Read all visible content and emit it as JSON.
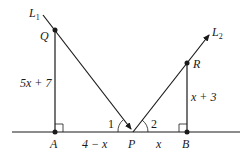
{
  "diagram": {
    "lines": {
      "l1": {
        "label": "L",
        "subscript": "1"
      },
      "l2": {
        "label": "L",
        "subscript": "2"
      }
    },
    "points": {
      "Q": "Q",
      "R": "R",
      "A": "A",
      "P": "P",
      "B": "B"
    },
    "segments": {
      "QA": "5x + 7",
      "RB": "x + 3",
      "AP": "4 − x",
      "PB": "x"
    },
    "angles": {
      "angle1": "1",
      "angle2": "2"
    },
    "colors": {
      "stroke": "#1a1a1a",
      "background": "#ffffff"
    }
  }
}
